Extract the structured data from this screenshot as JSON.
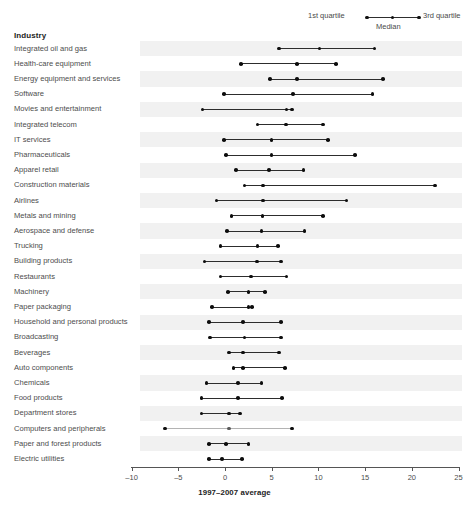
{
  "header": {
    "industry_column_title": "Industry"
  },
  "legend": {
    "first_quartile_label": "1st quartile",
    "median_label": "Median",
    "third_quartile_label": "3rd quartile"
  },
  "chart_data": {
    "type": "range-dot-plot",
    "title": "",
    "xlabel": "1997–2007 average",
    "ylabel": "Industry",
    "xlim": [
      -10,
      30
    ],
    "xticks": [
      -10,
      -5,
      0,
      5,
      10,
      15,
      20,
      25,
      30
    ],
    "xtick_labels": [
      "–10",
      "–5",
      "0",
      "5",
      "10",
      "15",
      "20",
      "25",
      "30"
    ],
    "grid": false,
    "legend_position": "top-right",
    "series": [
      {
        "name": "1st quartile"
      },
      {
        "name": "Median"
      },
      {
        "name": "3rd quartile"
      }
    ],
    "categories": [
      "Integrated oil and gas",
      "Health-care equipment",
      "Energy equipment and services",
      "Software",
      "Movies and entertainment",
      "Integrated telecom",
      "IT services",
      "Pharmaceuticals",
      "Apparel retail",
      "Construction materials",
      "Airlines",
      "Metals and mining",
      "Aerospace and defense",
      "Trucking",
      "Building products",
      "Restaurants",
      "Machinery",
      "Paper packaging",
      "Household and personal products",
      "Broadcasting",
      "Beverages",
      "Auto components",
      "Chemicals",
      "Food products",
      "Department stores",
      "Computers and peripherals",
      "Paper and forest products",
      "Electric utilities"
    ],
    "rows": [
      {
        "label": "Integrated oil and gas",
        "q1": 5.8,
        "median": 10.1,
        "q3": 16.0,
        "faded": false
      },
      {
        "label": "Health-care equipment",
        "q1": 1.7,
        "median": 7.7,
        "q3": 11.9,
        "faded": false
      },
      {
        "label": "Energy equipment and services",
        "q1": 4.8,
        "median": 7.7,
        "q3": 16.9,
        "faded": false
      },
      {
        "label": "Software",
        "q1": -0.1,
        "median": 7.3,
        "q3": 15.8,
        "faded": false
      },
      {
        "label": "Movies and entertainment",
        "q1": -2.4,
        "median": 6.6,
        "q3": 7.2,
        "faded": false
      },
      {
        "label": "Integrated telecom",
        "q1": 3.5,
        "median": 6.5,
        "q3": 10.5,
        "faded": false
      },
      {
        "label": "IT services",
        "q1": -0.1,
        "median": 5.0,
        "q3": 11.0,
        "faded": false
      },
      {
        "label": "Pharmaceuticals",
        "q1": 0.1,
        "median": 5.0,
        "q3": 13.9,
        "faded": false
      },
      {
        "label": "Apparel retail",
        "q1": 1.2,
        "median": 4.7,
        "q3": 8.4,
        "faded": false
      },
      {
        "label": "Construction materials",
        "q1": 2.1,
        "median": 4.1,
        "q3": 22.5,
        "faded": false
      },
      {
        "label": "Airlines",
        "q1": -0.9,
        "median": 4.1,
        "q3": 13.0,
        "faded": false
      },
      {
        "label": "Metals and mining",
        "q1": 0.7,
        "median": 4.0,
        "q3": 10.5,
        "faded": false
      },
      {
        "label": "Aerospace and defense",
        "q1": 0.2,
        "median": 3.9,
        "q3": 8.5,
        "faded": false
      },
      {
        "label": "Trucking",
        "q1": -0.5,
        "median": 3.5,
        "q3": 5.7,
        "faded": false
      },
      {
        "label": "Building products",
        "q1": -2.2,
        "median": 3.4,
        "q3": 6.0,
        "faded": false
      },
      {
        "label": "Restaurants",
        "q1": -0.5,
        "median": 2.8,
        "q3": 6.6,
        "faded": false
      },
      {
        "label": "Machinery",
        "q1": 0.3,
        "median": 2.5,
        "q3": 4.3,
        "faded": false
      },
      {
        "label": "Paper packaging",
        "q1": -1.4,
        "median": 2.5,
        "q3": 2.9,
        "faded": false
      },
      {
        "label": "Household and personal products",
        "q1": -1.7,
        "median": 1.9,
        "q3": 6.0,
        "faded": false
      },
      {
        "label": "Broadcasting",
        "q1": -1.6,
        "median": 2.1,
        "q3": 6.0,
        "faded": false
      },
      {
        "label": "Beverages",
        "q1": 0.4,
        "median": 1.9,
        "q3": 5.8,
        "faded": false
      },
      {
        "label": "Auto components",
        "q1": 0.9,
        "median": 1.9,
        "q3": 6.4,
        "faded": false
      },
      {
        "label": "Chemicals",
        "q1": -2.0,
        "median": 1.4,
        "q3": 3.9,
        "faded": false
      },
      {
        "label": "Food products",
        "q1": -2.5,
        "median": 1.4,
        "q3": 6.1,
        "faded": false
      },
      {
        "label": "Department stores",
        "q1": -2.5,
        "median": 0.4,
        "q3": 1.6,
        "faded": false
      },
      {
        "label": "Computers and peripherals",
        "q1": -6.4,
        "median": 0.4,
        "q3": 7.2,
        "faded": true
      },
      {
        "label": "Paper and forest products",
        "q1": -1.7,
        "median": 0.1,
        "q3": 2.5,
        "faded": false
      },
      {
        "label": "Electric utilities",
        "q1": -1.7,
        "median": -0.3,
        "q3": 1.8,
        "faded": false
      }
    ]
  }
}
